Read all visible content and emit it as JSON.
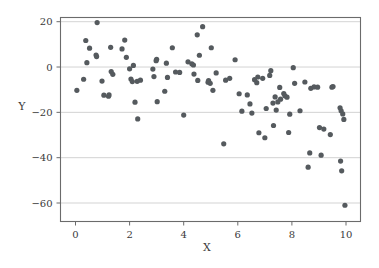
{
  "chart_data": {
    "type": "scatter",
    "title": "",
    "xlabel": "X",
    "ylabel": "Y",
    "xlim": [
      0,
      10
    ],
    "ylim": [
      -65,
      21
    ],
    "xticks": [
      0,
      2,
      4,
      6,
      8,
      10
    ],
    "xtick_labels": [
      "0",
      "2",
      "4",
      "6",
      "8",
      "10"
    ],
    "yticks": [
      20,
      0,
      -20,
      -40,
      -60
    ],
    "ytick_labels": [
      "20",
      "0",
      "−20",
      "−40",
      "−60"
    ],
    "grid": "horizontal",
    "legend": "none",
    "marker_color": "#555a5e",
    "marker_size": 2.6,
    "gridline_color": "#c8c8c8",
    "frame_color": "#6b6b6b",
    "background_color": "#ffffff",
    "n_points": 116,
    "points": [
      [
        0.05,
        -10.3
      ],
      [
        0.3,
        -5.4
      ],
      [
        0.38,
        11.7
      ],
      [
        0.42,
        1.9
      ],
      [
        0.52,
        8.3
      ],
      [
        0.76,
        5.3
      ],
      [
        0.78,
        4.6
      ],
      [
        0.8,
        19.6
      ],
      [
        0.98,
        -6.2
      ],
      [
        1.05,
        -12.4
      ],
      [
        1.22,
        -12.9
      ],
      [
        1.24,
        -12.3
      ],
      [
        1.3,
        8.7
      ],
      [
        1.32,
        -2.0
      ],
      [
        1.38,
        -3.2
      ],
      [
        1.72,
        8.0
      ],
      [
        1.82,
        11.9
      ],
      [
        1.88,
        4.3
      ],
      [
        2.0,
        -0.8
      ],
      [
        2.05,
        -5.3
      ],
      [
        2.1,
        -6.4
      ],
      [
        2.14,
        0.7
      ],
      [
        2.2,
        -15.5
      ],
      [
        2.28,
        -6.3
      ],
      [
        2.3,
        -22.9
      ],
      [
        2.4,
        -5.8
      ],
      [
        2.86,
        -0.9
      ],
      [
        2.9,
        -4.2
      ],
      [
        2.98,
        2.8
      ],
      [
        3.0,
        3.4
      ],
      [
        3.02,
        -15.3
      ],
      [
        3.3,
        -10.7
      ],
      [
        3.36,
        1.7
      ],
      [
        3.4,
        -4.6
      ],
      [
        3.58,
        8.5
      ],
      [
        3.7,
        -2.2
      ],
      [
        3.85,
        -2.4
      ],
      [
        4.0,
        -21.2
      ],
      [
        4.16,
        2.3
      ],
      [
        4.3,
        1.4
      ],
      [
        4.36,
        0.9
      ],
      [
        4.38,
        -3.1
      ],
      [
        4.5,
        14.2
      ],
      [
        4.52,
        -5.9
      ],
      [
        4.58,
        5.2
      ],
      [
        4.7,
        17.8
      ],
      [
        4.9,
        -6.7
      ],
      [
        4.92,
        -6.0
      ],
      [
        4.98,
        -7.2
      ],
      [
        5.02,
        8.5
      ],
      [
        5.08,
        -10.3
      ],
      [
        5.2,
        -2.6
      ],
      [
        5.48,
        -33.9
      ],
      [
        5.55,
        -5.8
      ],
      [
        5.7,
        -5.0
      ],
      [
        5.9,
        3.2
      ],
      [
        6.05,
        -11.8
      ],
      [
        6.15,
        -19.5
      ],
      [
        6.35,
        -12.3
      ],
      [
        6.45,
        -16.3
      ],
      [
        6.52,
        -20.3
      ],
      [
        6.62,
        -5.6
      ],
      [
        6.7,
        -6.9
      ],
      [
        6.74,
        -4.4
      ],
      [
        6.78,
        -29.0
      ],
      [
        6.92,
        -5.0
      ],
      [
        7.0,
        -31.2
      ],
      [
        7.05,
        -18.3
      ],
      [
        7.18,
        -3.7
      ],
      [
        7.22,
        -1.6
      ],
      [
        7.3,
        -15.9
      ],
      [
        7.32,
        -25.8
      ],
      [
        7.38,
        -13.2
      ],
      [
        7.42,
        -19.0
      ],
      [
        7.48,
        -15.4
      ],
      [
        7.55,
        -9.0
      ],
      [
        7.58,
        -14.2
      ],
      [
        7.7,
        -11.7
      ],
      [
        7.74,
        -12.7
      ],
      [
        7.82,
        -13.3
      ],
      [
        7.88,
        -28.9
      ],
      [
        7.92,
        -20.8
      ],
      [
        8.05,
        -0.3
      ],
      [
        8.1,
        -7.2
      ],
      [
        8.3,
        -19.3
      ],
      [
        8.48,
        -6.6
      ],
      [
        8.6,
        -44.2
      ],
      [
        8.66,
        -37.9
      ],
      [
        8.7,
        -9.4
      ],
      [
        8.82,
        -8.8
      ],
      [
        8.95,
        -8.9
      ],
      [
        9.02,
        -26.7
      ],
      [
        9.08,
        -38.9
      ],
      [
        9.18,
        -27.4
      ],
      [
        9.42,
        -29.8
      ],
      [
        9.48,
        -8.9
      ],
      [
        9.52,
        -8.6
      ],
      [
        9.78,
        -18.0
      ],
      [
        9.8,
        -41.5
      ],
      [
        9.82,
        -19.3
      ],
      [
        9.84,
        -45.8
      ],
      [
        9.88,
        -20.7
      ],
      [
        9.92,
        -23.1
      ],
      [
        9.96,
        -61.0
      ]
    ]
  },
  "axes": {
    "y_title": "Y",
    "x_title": "X"
  }
}
